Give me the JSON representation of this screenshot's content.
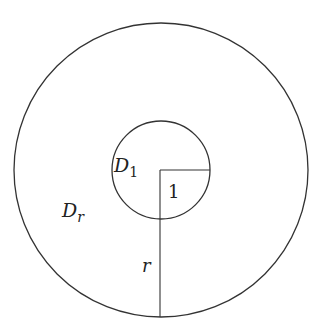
{
  "diagram": {
    "type": "annulus-domains",
    "stroke_color": "#333333",
    "background": "#ffffff",
    "outer_circle": {
      "cx": 161,
      "cy": 170,
      "r": 147
    },
    "inner_circle": {
      "cx": 161,
      "cy": 170,
      "r": 49
    },
    "inner_radius_segment": {
      "x1": 160,
      "y1": 170,
      "x2": 210,
      "y2": 170
    },
    "outer_radius_segment": {
      "x1": 160,
      "y1": 170,
      "x2": 160,
      "y2": 317
    },
    "labels": {
      "inner_region": {
        "main": "D",
        "sub": "1"
      },
      "outer_region": {
        "main": "D",
        "sub": "r"
      },
      "inner_radius": "1",
      "outer_radius": "r"
    }
  }
}
